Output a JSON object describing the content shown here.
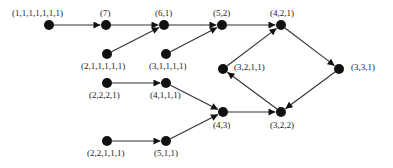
{
  "diagram": {
    "title": "",
    "colors": {
      "node": "#111111",
      "edge": "#333333",
      "label": "#222222",
      "background": "#ffffff"
    },
    "nodes": [
      {
        "id": "n1111111",
        "label": "(1,1,1,1,1,1,1)",
        "x": 49,
        "y": 25,
        "label_pos": "above",
        "lx": 12,
        "ly": 8
      },
      {
        "id": "n7",
        "label": "(7)",
        "x": 106,
        "y": 25,
        "label_pos": "above",
        "lx": 100,
        "ly": 8
      },
      {
        "id": "n61",
        "label": "(6,1)",
        "x": 164,
        "y": 25,
        "label_pos": "above",
        "lx": 155,
        "ly": 8
      },
      {
        "id": "n52",
        "label": "(5,2)",
        "x": 222,
        "y": 25,
        "label_pos": "above",
        "lx": 213,
        "ly": 8
      },
      {
        "id": "n421",
        "label": "(4,2,1)",
        "x": 281,
        "y": 25,
        "label_pos": "above",
        "lx": 270,
        "ly": 8
      },
      {
        "id": "n211111",
        "label": "(2,1,1,1,1,1)",
        "x": 107,
        "y": 54,
        "label_pos": "below",
        "lx": 81,
        "ly": 61
      },
      {
        "id": "n31111",
        "label": "(3,1,1,1,1)",
        "x": 166,
        "y": 54,
        "label_pos": "below",
        "lx": 149,
        "ly": 61
      },
      {
        "id": "n3211",
        "label": "(3,2,1,1)",
        "x": 223,
        "y": 69,
        "label_pos": "right",
        "lx": 234,
        "ly": 62
      },
      {
        "id": "n331",
        "label": "(3,3,1)",
        "x": 339,
        "y": 69,
        "label_pos": "right",
        "lx": 351,
        "ly": 62
      },
      {
        "id": "n2221",
        "label": "(2,2,2,1)",
        "x": 107,
        "y": 83,
        "label_pos": "below",
        "lx": 89,
        "ly": 90
      },
      {
        "id": "n4111",
        "label": "(4,1,1,1)",
        "x": 166,
        "y": 83,
        "label_pos": "below",
        "lx": 150,
        "ly": 90
      },
      {
        "id": "n43",
        "label": "(4,3)",
        "x": 223,
        "y": 112,
        "label_pos": "below",
        "lx": 213,
        "ly": 120
      },
      {
        "id": "n322",
        "label": "(3,2,2)",
        "x": 281,
        "y": 112,
        "label_pos": "below",
        "lx": 270,
        "ly": 120
      },
      {
        "id": "n22111",
        "label": "(2,2,1,1,1)",
        "x": 107,
        "y": 141,
        "label_pos": "below",
        "lx": 87,
        "ly": 148
      },
      {
        "id": "n511",
        "label": "(5,1,1)",
        "x": 166,
        "y": 141,
        "label_pos": "below",
        "lx": 154,
        "ly": 148
      }
    ],
    "edges": [
      {
        "from": "n1111111",
        "to": "n7"
      },
      {
        "from": "n7",
        "to": "n61"
      },
      {
        "from": "n211111",
        "to": "n61"
      },
      {
        "from": "n61",
        "to": "n52"
      },
      {
        "from": "n31111",
        "to": "n52"
      },
      {
        "from": "n52",
        "to": "n421"
      },
      {
        "from": "n3211",
        "to": "n421"
      },
      {
        "from": "n421",
        "to": "n331"
      },
      {
        "from": "n331",
        "to": "n322"
      },
      {
        "from": "n322",
        "to": "n3211"
      },
      {
        "from": "n2221",
        "to": "n4111"
      },
      {
        "from": "n4111",
        "to": "n43"
      },
      {
        "from": "n22111",
        "to": "n511"
      },
      {
        "from": "n511",
        "to": "n43"
      },
      {
        "from": "n43",
        "to": "n322"
      }
    ]
  }
}
